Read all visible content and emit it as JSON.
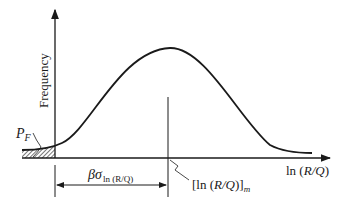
{
  "diagram": {
    "type": "probability-density-curve",
    "y_axis_label": "Frequency",
    "x_axis_label_prefix": "ln (",
    "x_axis_label_var": "R/Q",
    "x_axis_label_suffix": ")",
    "failure_prob_label_main": "P",
    "failure_prob_label_sub": "F",
    "distance_label_beta": "βσ",
    "distance_label_sub": "ln (R/Q)",
    "mean_label_prefix": "[ln (",
    "mean_label_var": "R/Q",
    "mean_label_suffix": ")]",
    "mean_label_sub": "m",
    "colors": {
      "line": "#1a1a1a",
      "background": "#ffffff"
    }
  }
}
